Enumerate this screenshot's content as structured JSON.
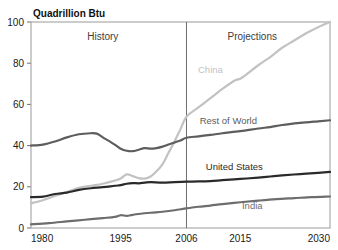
{
  "chart_data": {
    "type": "line",
    "title": "Quadrillion Btu",
    "xlabel": "",
    "ylabel": "Quadrillion Btu",
    "xlim": [
      1980,
      2030
    ],
    "ylim": [
      0,
      100
    ],
    "grid": false,
    "legend_position": "inline-labels",
    "xticks": [
      "1980",
      "1995",
      "2006",
      "2015",
      "2030"
    ],
    "xtick_values": [
      1980,
      1995,
      2006,
      2015,
      2030
    ],
    "yticks": [
      "0",
      "20",
      "40",
      "60",
      "80",
      "100"
    ],
    "ytick_values": [
      0,
      20,
      40,
      60,
      80,
      100
    ],
    "annotations": [
      {
        "text": "History",
        "x": 1992,
        "y": 93
      },
      {
        "text": "Projections",
        "x": 2017,
        "y": 93
      }
    ],
    "divider_x": 2006,
    "series": [
      {
        "name": "China",
        "color": "#c2c2c2",
        "label_x": 2010,
        "label_y": 77,
        "x": [
          1980,
          1982,
          1984,
          1986,
          1988,
          1990,
          1992,
          1994,
          1995,
          1996,
          1997,
          1998,
          1999,
          2000,
          2001,
          2002,
          2003,
          2004,
          2005,
          2006,
          2008,
          2010,
          2012,
          2014,
          2015,
          2016,
          2018,
          2020,
          2022,
          2024,
          2026,
          2028,
          2030
        ],
        "values": [
          12.0,
          13.5,
          15.5,
          17.5,
          19.5,
          20.5,
          21.5,
          23.0,
          24.0,
          26.0,
          25.2,
          24.2,
          24.0,
          25.0,
          27.5,
          31.0,
          36.5,
          42.0,
          48.0,
          54.0,
          58.5,
          63.0,
          67.5,
          71.5,
          72.5,
          74.5,
          79.0,
          83.0,
          87.5,
          91.0,
          94.5,
          97.5,
          100.0
        ]
      },
      {
        "name": "Rest of World",
        "color": "#5d5d5d",
        "label_x": 2013,
        "label_y": 52,
        "x": [
          1980,
          1982,
          1984,
          1986,
          1988,
          1990,
          1991,
          1992,
          1994,
          1995,
          1996,
          1997,
          1998,
          1999,
          2000,
          2001,
          2002,
          2003,
          2004,
          2005,
          2006,
          2008,
          2010,
          2012,
          2015,
          2018,
          2020,
          2022,
          2025,
          2028,
          2030
        ],
        "values": [
          40.0,
          40.5,
          42.0,
          44.0,
          45.5,
          46.0,
          45.8,
          44.0,
          40.5,
          38.5,
          37.5,
          37.3,
          38.0,
          38.8,
          38.5,
          38.8,
          39.5,
          40.5,
          41.5,
          42.5,
          43.8,
          44.5,
          45.2,
          46.0,
          47.0,
          48.3,
          49.0,
          50.0,
          51.0,
          51.8,
          52.3
        ]
      },
      {
        "name": "United States",
        "color": "#2a2a2a",
        "label_x": 2014,
        "label_y": 30,
        "x": [
          1980,
          1982,
          1984,
          1986,
          1988,
          1990,
          1992,
          1994,
          1995,
          1996,
          1997,
          1998,
          1999,
          2000,
          2002,
          2004,
          2006,
          2008,
          2010,
          2012,
          2015,
          2018,
          2020,
          2022,
          2025,
          2028,
          2030
        ],
        "values": [
          15.0,
          15.2,
          16.5,
          17.2,
          18.5,
          19.3,
          19.8,
          20.5,
          20.8,
          21.5,
          21.8,
          21.7,
          22.0,
          22.3,
          22.0,
          22.3,
          22.5,
          22.6,
          22.8,
          23.2,
          23.8,
          24.5,
          25.0,
          25.5,
          26.2,
          26.8,
          27.2
        ]
      },
      {
        "name": "India",
        "color": "#6d6d6d",
        "label_x": 2017,
        "label_y": 11,
        "x": [
          1980,
          1983,
          1986,
          1989,
          1992,
          1994,
          1995,
          1996,
          1997,
          1998,
          2000,
          2002,
          2004,
          2006,
          2008,
          2010,
          2012,
          2015,
          2018,
          2021,
          2024,
          2027,
          2030
        ],
        "values": [
          1.8,
          2.4,
          3.2,
          4.0,
          4.8,
          5.4,
          6.2,
          5.9,
          6.4,
          6.8,
          7.4,
          7.9,
          8.6,
          9.5,
          10.3,
          10.9,
          11.6,
          12.5,
          13.3,
          14.0,
          14.5,
          15.0,
          15.3
        ]
      }
    ]
  },
  "layout": {
    "plot_left": 31,
    "plot_right": 330,
    "plot_top": 22,
    "plot_bottom": 228
  }
}
